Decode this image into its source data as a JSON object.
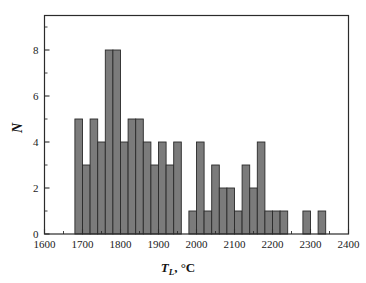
{
  "chart_data": {
    "type": "bar",
    "subtype": "histogram",
    "title": "",
    "xlabel": "T_L, °C",
    "xlabel_symbol": "T",
    "xlabel_subscript": "L",
    "xlabel_unit": ", °C",
    "ylabel": "N",
    "xlim": [
      1600,
      2400
    ],
    "ylim": [
      0,
      9.5
    ],
    "x_major_ticks": [
      1600,
      1700,
      1800,
      1900,
      2000,
      2100,
      2200,
      2300,
      2400
    ],
    "x_major_tick_labels": [
      "1600",
      "1700",
      "1800",
      "1900",
      "2000",
      "2100",
      "2200",
      "2300",
      "2400"
    ],
    "x_minor_tick_step": 50,
    "y_major_ticks": [
      0,
      2,
      4,
      6,
      8
    ],
    "y_major_tick_labels": [
      "0",
      "2",
      "4",
      "6",
      "8"
    ],
    "y_minor_tick_step": 1,
    "grid": false,
    "legend": false,
    "bin_width": 20,
    "bin_starts": [
      1680,
      1700,
      1720,
      1740,
      1760,
      1780,
      1800,
      1820,
      1840,
      1860,
      1880,
      1900,
      1920,
      1940,
      1980,
      2000,
      2020,
      2040,
      2060,
      2080,
      2100,
      2120,
      2140,
      2160,
      2180,
      2200,
      2220,
      2280,
      2320
    ],
    "values": [
      5,
      3,
      5,
      4,
      8,
      8,
      4,
      5,
      5,
      4,
      3,
      4,
      3,
      4,
      1,
      4,
      1,
      3,
      2,
      2,
      1,
      3,
      2,
      4,
      1,
      1,
      1,
      1,
      1
    ],
    "bar_fill_color": "#7b7b7b",
    "bar_edge_color": "#2a2a2a",
    "axis_color": "#2b2b2b",
    "background_color": "#ffffff"
  },
  "figure": {
    "frame": "box",
    "tick_direction": "in"
  }
}
